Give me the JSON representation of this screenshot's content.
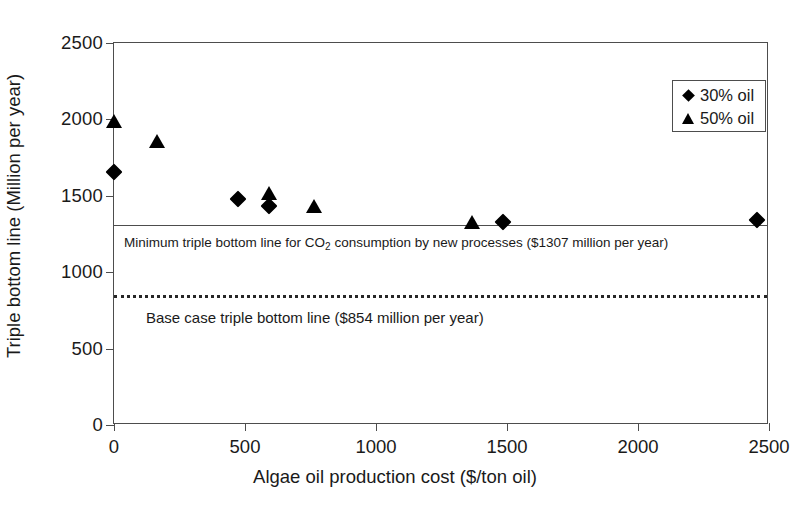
{
  "chart_data": {
    "type": "scatter",
    "title": "",
    "xlabel": "Algae oil production cost ($/ton oil)",
    "ylabel": "Triple bottom line (Million per year)",
    "xlim": [
      0,
      2500
    ],
    "ylim": [
      0,
      2500
    ],
    "xticks": [
      0,
      500,
      1000,
      1500,
      2000,
      2500
    ],
    "yticks": [
      0,
      500,
      1000,
      1500,
      2000,
      2500
    ],
    "grid": false,
    "legend_position": "top-right",
    "series": [
      {
        "name": "30% oil",
        "marker": "diamond",
        "color": "#000000",
        "points": [
          {
            "x": 0,
            "y": 1655
          },
          {
            "x": 473,
            "y": 1478
          },
          {
            "x": 593,
            "y": 1432
          },
          {
            "x": 1484,
            "y": 1330
          },
          {
            "x": 2455,
            "y": 1340
          }
        ]
      },
      {
        "name": "50% oil",
        "marker": "triangle",
        "color": "#000000",
        "points": [
          {
            "x": 0,
            "y": 1980
          },
          {
            "x": 163,
            "y": 1850
          },
          {
            "x": 593,
            "y": 1515
          },
          {
            "x": 764,
            "y": 1425
          },
          {
            "x": 1368,
            "y": 1320
          }
        ]
      }
    ],
    "reference_lines": [
      {
        "name": "minimum-triple-bottom-line",
        "y": 1307,
        "style": "solid",
        "label_prefix": "Minimum triple bottom line for CO",
        "label_sub": "2",
        "label_suffix": " consumption by new processes ($1307 million per year)"
      },
      {
        "name": "base-case-triple-bottom-line",
        "y": 854,
        "style": "dotted",
        "label": "Base case triple bottom line ($854 million per year)"
      }
    ]
  },
  "legend": {
    "entries": [
      {
        "label": "30% oil",
        "glyph": "diamond-icon"
      },
      {
        "label": "50% oil",
        "glyph": "triangle-icon"
      }
    ]
  }
}
